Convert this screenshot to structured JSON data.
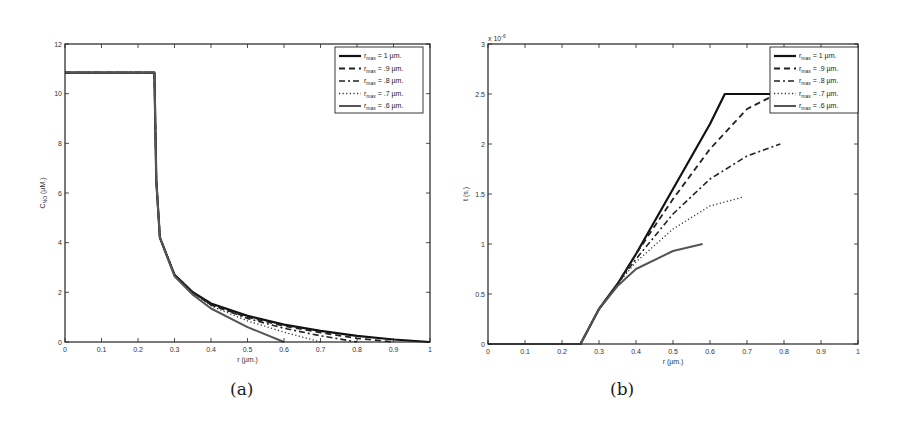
{
  "chart_data": [
    {
      "type": "line",
      "panel_label": "(a)",
      "title": "",
      "xlabel": "r (µm.)",
      "ylabel": "C_NO (µM.)",
      "ylabel_main": "C",
      "ylabel_sub": "NO",
      "ylabel_unit": " (µM.)",
      "xlim": [
        0,
        1
      ],
      "ylim": [
        0,
        12
      ],
      "xticks": [
        "0",
        "0.1",
        "0.2",
        "0.3",
        "0.4",
        "0.5",
        "0.6",
        "0.7",
        "0.8",
        "0.9",
        "1"
      ],
      "yticks": [
        "0",
        "2",
        "4",
        "6",
        "8",
        "10",
        "12"
      ],
      "grid": false,
      "legend_position": "upper right",
      "series": [
        {
          "name": "r_max = 1 µm.",
          "style": "solid-thick",
          "x": [
            0,
            0.245,
            0.25,
            0.26,
            0.3,
            0.35,
            0.4,
            0.5,
            0.6,
            0.7,
            0.8,
            0.9,
            1.0
          ],
          "y": [
            10.85,
            10.85,
            6.5,
            4.2,
            2.7,
            2.0,
            1.55,
            1.05,
            0.7,
            0.45,
            0.25,
            0.1,
            0
          ]
        },
        {
          "name": "r_max = .9 µm.",
          "style": "dashed",
          "x": [
            0,
            0.245,
            0.25,
            0.26,
            0.3,
            0.35,
            0.4,
            0.5,
            0.6,
            0.7,
            0.8,
            0.9
          ],
          "y": [
            10.85,
            10.85,
            6.5,
            4.2,
            2.7,
            2.0,
            1.5,
            1.0,
            0.65,
            0.38,
            0.15,
            0
          ]
        },
        {
          "name": "r_max = .8 µm.",
          "style": "dashdot",
          "x": [
            0,
            0.245,
            0.25,
            0.26,
            0.3,
            0.35,
            0.4,
            0.5,
            0.6,
            0.7,
            0.8
          ],
          "y": [
            10.85,
            10.85,
            6.5,
            4.2,
            2.7,
            2.0,
            1.5,
            0.95,
            0.55,
            0.25,
            0
          ]
        },
        {
          "name": "r_max = .7 µm.",
          "style": "dotted",
          "x": [
            0,
            0.245,
            0.25,
            0.26,
            0.3,
            0.35,
            0.4,
            0.5,
            0.6,
            0.7
          ],
          "y": [
            10.85,
            10.85,
            6.5,
            4.2,
            2.7,
            1.95,
            1.45,
            0.85,
            0.4,
            0
          ]
        },
        {
          "name": "r_max = .6 µm.",
          "style": "solid-gray",
          "x": [
            0,
            0.245,
            0.25,
            0.26,
            0.3,
            0.35,
            0.4,
            0.5,
            0.6
          ],
          "y": [
            10.85,
            10.85,
            6.5,
            4.2,
            2.65,
            1.9,
            1.35,
            0.6,
            0
          ]
        }
      ]
    },
    {
      "type": "line",
      "panel_label": "(b)",
      "title": "",
      "xlabel": "r (µm.)",
      "ylabel": "t (s.)",
      "y_exponent": "x 10",
      "y_exponent_power": "-6",
      "xlim": [
        0,
        1
      ],
      "ylim": [
        0,
        3
      ],
      "xticks": [
        "0",
        "0.1",
        "0.2",
        "0.3",
        "0.4",
        "0.5",
        "0.6",
        "0.7",
        "0.8",
        "0.9",
        "1"
      ],
      "yticks": [
        "0",
        "0.5",
        "1",
        "1.5",
        "2",
        "2.5",
        "3"
      ],
      "grid": false,
      "legend_position": "upper right",
      "series": [
        {
          "name": "r_max = 1 µm.",
          "style": "solid-thick",
          "x": [
            0,
            0.25,
            0.3,
            0.35,
            0.4,
            0.5,
            0.6,
            0.64,
            0.8
          ],
          "y": [
            0,
            0,
            0.35,
            0.6,
            0.9,
            1.55,
            2.2,
            2.5,
            2.5
          ]
        },
        {
          "name": "r_max = .9 µm.",
          "style": "dashed",
          "x": [
            0,
            0.25,
            0.3,
            0.35,
            0.4,
            0.5,
            0.6,
            0.7,
            0.78
          ],
          "y": [
            0,
            0,
            0.35,
            0.6,
            0.9,
            1.45,
            1.95,
            2.35,
            2.5
          ]
        },
        {
          "name": "r_max = .8 µm.",
          "style": "dashdot",
          "x": [
            0,
            0.25,
            0.3,
            0.35,
            0.4,
            0.5,
            0.6,
            0.7,
            0.79
          ],
          "y": [
            0,
            0,
            0.35,
            0.6,
            0.85,
            1.3,
            1.65,
            1.88,
            2.0
          ]
        },
        {
          "name": "r_max = .7 µm.",
          "style": "dotted",
          "x": [
            0,
            0.25,
            0.3,
            0.35,
            0.4,
            0.5,
            0.6,
            0.69
          ],
          "y": [
            0,
            0,
            0.35,
            0.6,
            0.82,
            1.15,
            1.38,
            1.47
          ]
        },
        {
          "name": "r_max = .6 µm.",
          "style": "solid-gray",
          "x": [
            0,
            0.25,
            0.3,
            0.35,
            0.4,
            0.5,
            0.58
          ],
          "y": [
            0,
            0,
            0.35,
            0.58,
            0.75,
            0.93,
            1.0
          ]
        }
      ]
    }
  ],
  "legend": [
    {
      "prefix": "r",
      "sub": "max",
      "suffix": " = 1 µm."
    },
    {
      "prefix": "r",
      "sub": "max",
      "suffix": " = .9 µm."
    },
    {
      "prefix": "r",
      "sub": "max",
      "suffix": " = .8 µm."
    },
    {
      "prefix": "r",
      "sub": "max",
      "suffix": " = .7 µm."
    },
    {
      "prefix": "r",
      "sub": "max",
      "suffix": " = .6 µm."
    }
  ],
  "styles": {
    "solid-thick": {
      "stroke": "#111111",
      "width": 2.2,
      "dash": ""
    },
    "dashed": {
      "stroke": "#222222",
      "width": 1.8,
      "dash": "6,4"
    },
    "dashdot": {
      "stroke": "#222222",
      "width": 1.6,
      "dash": "6,3,2,3"
    },
    "dotted": {
      "stroke": "#333333",
      "width": 1.3,
      "dash": "1.2,2.4"
    },
    "solid-gray": {
      "stroke": "#555555",
      "width": 2.0,
      "dash": ""
    }
  }
}
